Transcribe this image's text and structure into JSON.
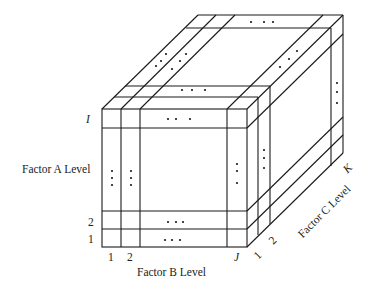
{
  "diagram": {
    "type": "three-factor factorial design cube",
    "axis_labels": {
      "factor_a": "Factor A Level",
      "factor_b": "Factor B Level",
      "factor_c": "Factor C Level"
    },
    "factor_a_ticks": [
      "1",
      "2",
      "I"
    ],
    "factor_b_ticks": [
      "1",
      "2",
      "J"
    ],
    "factor_c_ticks": [
      "1",
      "2",
      "K"
    ],
    "ellipsis": "• • •",
    "line_color": "#1a1a1a",
    "background": "#ffffff"
  }
}
